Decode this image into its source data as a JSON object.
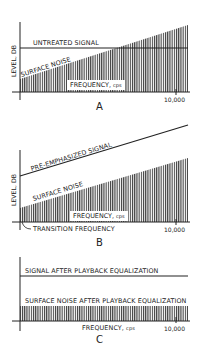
{
  "panels": [
    {
      "letter": "A",
      "ylabel": "LEVEL, DB",
      "signal_label": "UNTREATED SIGNAL",
      "noise_label": "SURFACE NOISE",
      "xlabel": "FREQUENCY,",
      "xunit": "cps",
      "tick_label": "10,000"
    },
    {
      "letter": "B",
      "ylabel": "LEVEL, DB",
      "signal_label": "PRE-EMPHASIZED SIGNAL",
      "noise_label": "SURFACE NOISE",
      "xlabel": "FREQUENCY,",
      "xunit": "cps",
      "tick_label": "10,000",
      "annotation": "TRANSITION FREQUENCY"
    },
    {
      "letter": "C",
      "signal_label": "SIGNAL AFTER PLAYBACK EQUALIZATION",
      "noise_label": "SURFACE NOISE AFTER PLAYBACK EQUALIZATION",
      "xlabel": "FREQUENCY,",
      "xunit": "cps",
      "tick_label": "10,000"
    }
  ],
  "colors": {
    "ink": "#222222",
    "hatch": "#333333",
    "background": "#ffffff"
  }
}
